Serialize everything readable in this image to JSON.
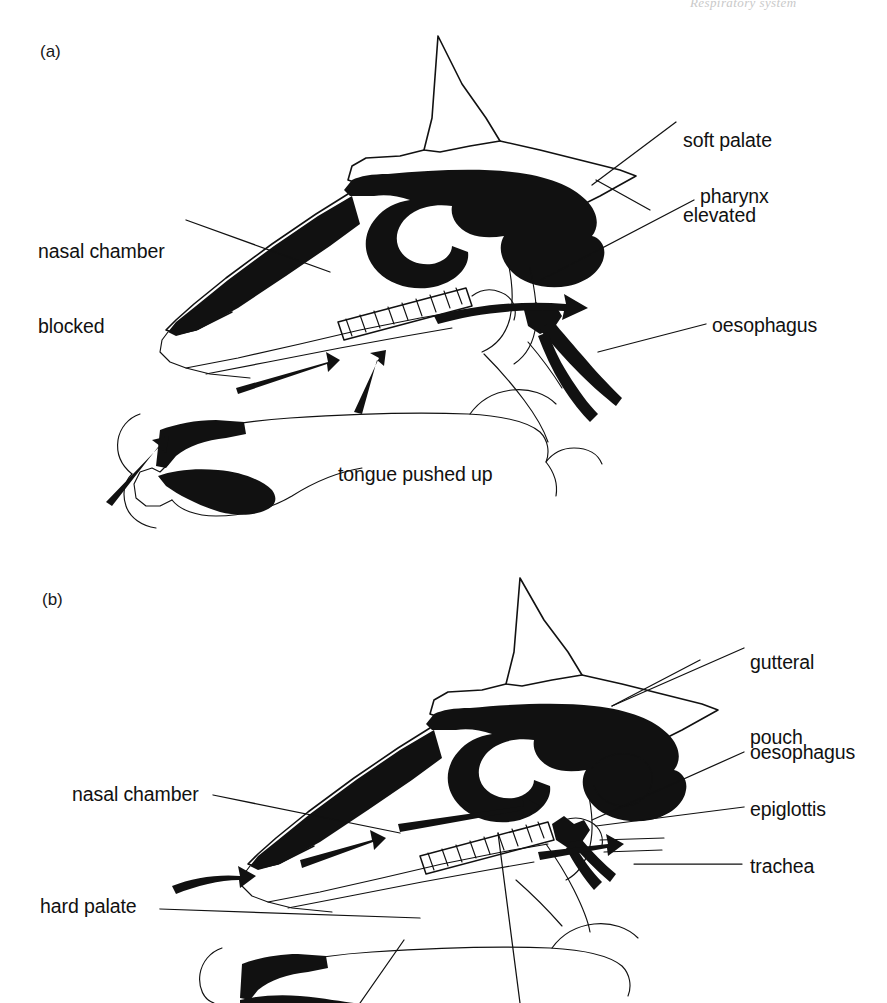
{
  "page": {
    "width": 887,
    "height": 1003,
    "background": "#ffffff",
    "ink_color": "#111111",
    "running_head": "Respiratory system",
    "figure_kind": "line-drawing anatomical diagram"
  },
  "panels": [
    {
      "id": "a",
      "tag": "(a)",
      "tag_pos": {
        "x": 40,
        "y": 42
      },
      "caption_state": "swallowing: nasal chamber blocked, soft palate elevated, tongue pushed up",
      "labels": [
        {
          "name": "soft-palate-elevated",
          "text_lines": [
            "soft palate",
            "elevated"
          ],
          "x": 683,
          "y": 78,
          "leader": {
            "x1": 676,
            "y1": 122,
            "x2": 592,
            "y2": 185
          }
        },
        {
          "name": "pharynx",
          "text_lines": [
            "pharynx"
          ],
          "x": 700,
          "y": 184,
          "leader": {
            "x1": 694,
            "y1": 200,
            "x2": 541,
            "y2": 280
          }
        },
        {
          "name": "oesophagus",
          "text_lines": [
            "oesophagus"
          ],
          "x": 712,
          "y": 313,
          "leader": {
            "x1": 706,
            "y1": 324,
            "x2": 598,
            "y2": 352
          }
        },
        {
          "name": "nasal-chamber-blocked",
          "text_lines": [
            "nasal chamber",
            "blocked"
          ],
          "x": 38,
          "y": 189,
          "leader": {
            "x1": 186,
            "y1": 220,
            "x2": 330,
            "y2": 272
          }
        },
        {
          "name": "tongue-pushed-up",
          "text_lines": [
            "tongue pushed up"
          ],
          "x": 338,
          "y": 462,
          "leader": null
        }
      ],
      "flow_arrows": [
        {
          "name": "bolus-arrow-lower",
          "from": [
            238,
            385
          ],
          "to": [
            330,
            358
          ],
          "meaning": "bolus moving back"
        },
        {
          "name": "bolus-arrow-upward",
          "from": [
            355,
            408
          ],
          "to": [
            380,
            355
          ],
          "meaning": "tongue lifting bolus"
        },
        {
          "name": "bolus-arrow-pharynx",
          "from": [
            437,
            313
          ],
          "to": [
            588,
            315
          ],
          "meaning": "bolus into pharynx"
        },
        {
          "name": "bolus-arrow-mouth",
          "from": [
            108,
            498
          ],
          "to": [
            162,
            443
          ],
          "meaning": "food entering mouth"
        }
      ]
    },
    {
      "id": "b",
      "tag": "(b)",
      "tag_pos": {
        "x": 42,
        "y": 590
      },
      "caption_state": "breathing: air passes through nasal chamber, soft palate down, epiglottis over trachea",
      "labels": [
        {
          "name": "gutteral-pouch",
          "text_lines": [
            "gutteral",
            "pouch"
          ],
          "x": 750,
          "y": 600,
          "leader": {
            "x1": 744,
            "y1": 648,
            "x2": 612,
            "y2": 706
          }
        },
        {
          "name": "oesophagus",
          "text_lines": [
            "oesophagus"
          ],
          "x": 750,
          "y": 740,
          "leader": {
            "x1": 744,
            "y1": 752,
            "x2": 592,
            "y2": 820
          }
        },
        {
          "name": "epiglottis",
          "text_lines": [
            "epiglottis"
          ],
          "x": 750,
          "y": 797,
          "leader": {
            "x1": 744,
            "y1": 807,
            "x2": 596,
            "y2": 826
          }
        },
        {
          "name": "trachea",
          "text_lines": [
            "trachea"
          ],
          "x": 750,
          "y": 854,
          "leader": {
            "x1": 742,
            "y1": 864,
            "x2": 634,
            "y2": 864
          }
        },
        {
          "name": "nasal-chamber",
          "text_lines": [
            "nasal chamber"
          ],
          "x": 72,
          "y": 782,
          "leader": {
            "x1": 213,
            "y1": 795,
            "x2": 400,
            "y2": 833
          }
        },
        {
          "name": "hard-palate",
          "text_lines": [
            "hard palate"
          ],
          "x": 40,
          "y": 894,
          "leader": {
            "x1": 160,
            "y1": 909,
            "x2": 420,
            "y2": 918
          }
        },
        {
          "name": "soft-palate-leader",
          "text_lines": [],
          "x": 0,
          "y": 0,
          "leader": {
            "x1": 498,
            "y1": 833,
            "x2": 518,
            "y2": 1003
          }
        }
      ],
      "flow_arrows": [
        {
          "name": "air-arrow-upper",
          "from": [
            400,
            820
          ],
          "to": [
            530,
            812
          ],
          "meaning": "inhaled air"
        },
        {
          "name": "air-arrow-mid",
          "from": [
            300,
            855
          ],
          "to": [
            378,
            838
          ],
          "meaning": "inhaled air"
        },
        {
          "name": "air-arrow-lower",
          "from": [
            175,
            880
          ],
          "to": [
            245,
            872
          ],
          "meaning": "air entering nostril"
        },
        {
          "name": "air-arrow-trachea",
          "from": [
            540,
            848
          ],
          "to": [
            618,
            845
          ],
          "meaning": "air to trachea"
        }
      ]
    }
  ],
  "legend_note": "Hatched band = soft palate; solid black = nasal chamber / airway; open outline = mouth, tongue and jaw"
}
